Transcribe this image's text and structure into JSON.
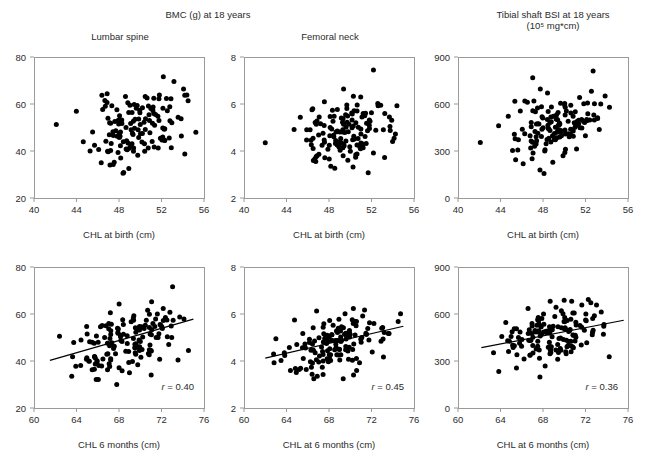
{
  "figure": {
    "group_titles": [
      {
        "text": "BMC (g) at 18 years",
        "sub": ""
      },
      {
        "text": "Tibial shaft BSI at 18 years",
        "sub": "(10⁵ mg*cm)"
      }
    ],
    "bottom_fragment": ""
  },
  "chart_data": [
    {
      "id": "lumbar-birth",
      "type": "scatter",
      "title": "Lumbar spine",
      "group_title": "BMC (g) at 18 years",
      "xlabel": "CHL at birth (cm)",
      "ylabel": "",
      "xlim": [
        40,
        56
      ],
      "ylim": [
        20,
        80
      ],
      "xticks": [
        40,
        44,
        48,
        52,
        56
      ],
      "yticks": [
        20,
        40,
        60,
        80
      ],
      "grid": false,
      "legend": "none",
      "regression": null,
      "r": null,
      "n": 143,
      "seed": 11,
      "x_center": 49.6,
      "x_spread": 2.1,
      "y_center": 49.5,
      "y_spread": 8.2,
      "corr": 0.28,
      "outliers": [
        [
          42.1,
          51.3
        ]
      ]
    },
    {
      "id": "femoral-birth",
      "type": "scatter",
      "title": "Femoral neck",
      "group_title": "BMC (g) at 18 years",
      "xlabel": "CHL at birth (cm)",
      "ylabel": "",
      "xlim": [
        40,
        56
      ],
      "ylim": [
        2,
        8
      ],
      "xticks": [
        40,
        44,
        48,
        52,
        56
      ],
      "yticks": [
        2,
        4,
        6,
        8
      ],
      "grid": false,
      "legend": "none",
      "regression": null,
      "r": null,
      "n": 143,
      "seed": 23,
      "x_center": 49.4,
      "x_spread": 2.2,
      "y_center": 4.72,
      "y_spread": 0.78,
      "corr": 0.26,
      "outliers": [
        [
          42.0,
          4.35
        ]
      ]
    },
    {
      "id": "tibial-birth",
      "type": "scatter",
      "title": "",
      "group_title": "Tibial shaft BSI at 18 years (10⁵ mg*cm)",
      "xlabel": "CHL at birth (cm)",
      "ylabel": "",
      "xlim": [
        40,
        56
      ],
      "ylim": [
        0,
        900
      ],
      "xticks": [
        40,
        44,
        48,
        52,
        56
      ],
      "yticks": [
        0,
        300,
        600,
        900
      ],
      "grid": false,
      "legend": "none",
      "regression": null,
      "r": null,
      "n": 143,
      "seed": 37,
      "x_center": 49.5,
      "x_spread": 2.1,
      "y_center": 470,
      "y_spread": 110,
      "corr": 0.25,
      "outliers": [
        [
          42.1,
          355
        ]
      ]
    },
    {
      "id": "lumbar-6mo",
      "type": "scatter",
      "title": "",
      "group_title": "BMC (g) at 18 years",
      "xlabel": "CHL 6 months (cm)",
      "ylabel": "",
      "xlim": [
        60,
        76
      ],
      "ylim": [
        20,
        80
      ],
      "xticks": [
        60,
        64,
        68,
        72,
        76
      ],
      "yticks": [
        20,
        40,
        60,
        80
      ],
      "grid": false,
      "legend": "none",
      "regression": {
        "x1": 61.5,
        "y1": 40.3,
        "x2": 75.0,
        "y2": 57.8
      },
      "r": "r = 0.40",
      "r_value": 0.4,
      "n": 150,
      "seed": 51,
      "x_center": 68.4,
      "x_spread": 2.5,
      "y_center": 47.5,
      "y_spread": 7.6,
      "corr": 0.4,
      "outliers": [
        [
          62.4,
          50.5
        ]
      ]
    },
    {
      "id": "femoral-6mo",
      "type": "scatter",
      "title": "",
      "group_title": "BMC (g) at 18 years",
      "xlabel": "CHL at 6 months (cm)",
      "ylabel": "",
      "xlim": [
        60,
        76
      ],
      "ylim": [
        2,
        8
      ],
      "xticks": [
        60,
        64,
        68,
        72,
        76
      ],
      "yticks": [
        2,
        4,
        6,
        8
      ],
      "grid": false,
      "legend": "none",
      "regression": {
        "x1": 62.0,
        "y1": 4.12,
        "x2": 75.0,
        "y2": 5.48
      },
      "r": "r = 0.45",
      "r_value": 0.45,
      "n": 150,
      "seed": 67,
      "x_center": 68.5,
      "x_spread": 2.6,
      "y_center": 4.78,
      "y_spread": 0.68,
      "corr": 0.45,
      "outliers": [
        [
          63.0,
          4.95
        ]
      ]
    },
    {
      "id": "tibial-6mo",
      "type": "scatter",
      "title": "",
      "group_title": "Tibial shaft BSI at 18 years (10⁵ mg*cm)",
      "xlabel": "CHL at 6 months (cm)",
      "ylabel": "",
      "xlim": [
        60,
        76
      ],
      "ylim": [
        0,
        900
      ],
      "xticks": [
        60,
        64,
        68,
        72,
        76
      ],
      "yticks": [
        0,
        300,
        600,
        900
      ],
      "grid": false,
      "legend": "none",
      "regression": {
        "x1": 62.2,
        "y1": 385,
        "x2": 75.6,
        "y2": 560
      },
      "r": "r = 0.36",
      "r_value": 0.36,
      "n": 150,
      "seed": 83,
      "x_center": 68.6,
      "x_spread": 2.5,
      "y_center": 472,
      "y_spread": 98,
      "corr": 0.36,
      "outliers": [
        [
          68.2,
          268
        ]
      ]
    }
  ]
}
